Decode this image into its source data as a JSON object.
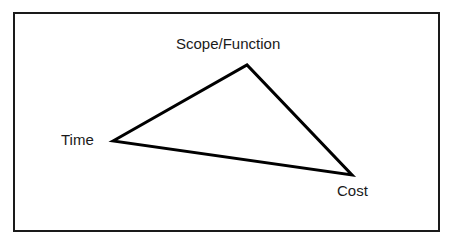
{
  "diagram": {
    "type": "triangle",
    "name": "project-management-triangle",
    "frame": {
      "border_color": "#1a1a1a",
      "background_color": "#ffffff",
      "border_width_px": 2
    },
    "stroke_color": "#000000",
    "stroke_width_px": 3,
    "fill_color": "none",
    "vertices": [
      {
        "id": "scope",
        "label": "Scope/Function",
        "x": 247,
        "y": 65,
        "label_position": "above"
      },
      {
        "id": "time",
        "label": "Time",
        "x": 113,
        "y": 141,
        "label_position": "left"
      },
      {
        "id": "cost",
        "label": "Cost",
        "x": 352,
        "y": 175,
        "label_position": "below-right"
      }
    ],
    "edges": [
      {
        "from": "time",
        "to": "scope"
      },
      {
        "from": "scope",
        "to": "cost"
      },
      {
        "from": "cost",
        "to": "time"
      }
    ],
    "points_attr": "113,141 247,65 352,175"
  }
}
